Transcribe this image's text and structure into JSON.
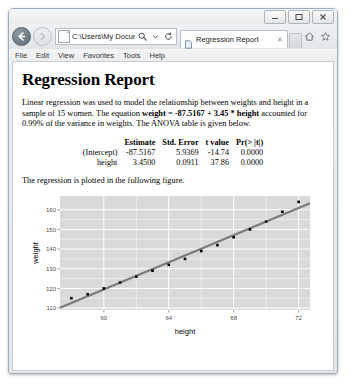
{
  "browser": {
    "window_controls": {
      "minimize": "minimize-button",
      "maximize": "maximize-button",
      "close": "close-button"
    },
    "back_label": "←",
    "forward_label": "→",
    "address_value": "C:\\Users\\My Docume",
    "address_placeholder": "Address",
    "search_icon": "search-icon",
    "refresh_icon": "refresh-icon",
    "tab": {
      "title": "Regression Report",
      "close_label": "✕"
    },
    "tool_icons": [
      "home-icon",
      "favorites-star-icon",
      "settings-gear-icon"
    ],
    "menu": [
      "File",
      "Edit",
      "View",
      "Favorites",
      "Tools",
      "Help"
    ]
  },
  "document": {
    "title": "Regression Report",
    "paragraph_1_part_1": "Linear regression was used to model the relationship between weights and height in a sample of 15 women. The equation ",
    "paragraph_1_bold": "weight = -87.5167 + 3.45 * height",
    "paragraph_1_part_2": " accounted for 0.99% of the variance in weights. The ANOVA table is given below.",
    "table": {
      "headers": [
        "",
        "Estimate",
        "Std. Error",
        "t value",
        "Pr(> |t|)"
      ],
      "rows": [
        [
          "(Intercept)",
          "-87.5167",
          "5.9369",
          "-14.74",
          "0.0000"
        ],
        [
          "height",
          "3.4500",
          "0.0911",
          "37.86",
          "0.0000"
        ]
      ]
    },
    "paragraph_2": "The regression is plotted in the following figure."
  },
  "chart_data": {
    "type": "scatter",
    "title": "",
    "xlabel": "height",
    "ylabel": "weight",
    "xlim": [
      57.3,
      72.7
    ],
    "ylim": [
      109.0,
      167.0
    ],
    "xticks": [
      60,
      64,
      68,
      72
    ],
    "yticks": [
      110,
      120,
      130,
      140,
      150,
      160
    ],
    "grid": true,
    "panel_background": "#d9d9d9",
    "grid_color": "#ffffff",
    "point_color": "#000000",
    "line_color": "#6a6a6a",
    "x": [
      58,
      59,
      60,
      61,
      62,
      63,
      64,
      65,
      66,
      67,
      68,
      69,
      70,
      71,
      72
    ],
    "y": [
      115,
      117,
      120,
      123,
      126,
      129,
      132,
      135,
      139,
      142,
      146,
      150,
      154,
      159,
      164
    ],
    "fit_line": {
      "intercept": -87.5167,
      "slope": 3.45
    },
    "legend": null
  }
}
